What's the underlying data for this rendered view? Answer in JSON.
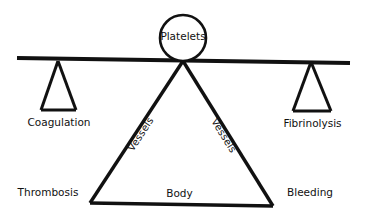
{
  "diagram": {
    "background_color": "#ffffff",
    "stroke_color": "#111111",
    "fulcrum": {
      "label": "Platelets",
      "shape": "circle",
      "center_x": 183,
      "center_y": 38,
      "radius": 23
    },
    "beam": {
      "name": "balance-beam",
      "x1": 17,
      "y1": 58,
      "x2": 350,
      "y2": 63
    },
    "left_pan": {
      "label": "Coagulation",
      "apex_x": 58,
      "apex_y": 61,
      "base_left_x": 41,
      "base_right_x": 76,
      "base_y": 110
    },
    "right_pan": {
      "label": "Fibrinolysis",
      "apex_x": 311,
      "apex_y": 62,
      "base_left_x": 293,
      "base_right_x": 331,
      "base_y": 111
    },
    "body_triangle": {
      "label": "Body",
      "apex_x": 183,
      "apex_y": 61,
      "base_left_x": 90,
      "base_left_y": 203,
      "base_right_x": 273,
      "base_right_y": 206,
      "left_edge_label": "Vessels",
      "right_edge_label": "Vessels"
    },
    "corner_labels": {
      "left": "Thrombosis",
      "right": "Bleeding"
    }
  }
}
